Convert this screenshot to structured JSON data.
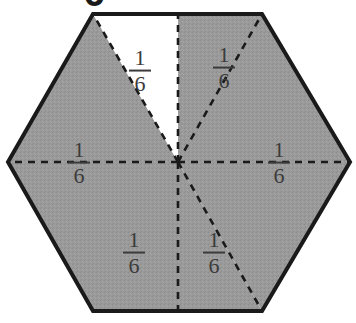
{
  "figure": {
    "name": "shaded-hexagon-sixths",
    "shape": "hexagon",
    "total_parts": 6,
    "shaded_parts": 5,
    "unshaded_parts": 1,
    "fill_shaded": "#9a9a9a",
    "fill_unshaded": "#ffffff",
    "outline_color": "#1a1a1a",
    "divider_color": "#1a1a1a",
    "divider_style": "dashed",
    "clipped_glyph_top": "6",
    "sectors": [
      {
        "id": "sector-top-left",
        "label_num": "1",
        "label_den": "6",
        "shaded": false,
        "cx": 140,
        "cy": 71
      },
      {
        "id": "sector-top-right",
        "label_num": "1",
        "label_den": "6",
        "shaded": true,
        "cx": 224,
        "cy": 68
      },
      {
        "id": "sector-right",
        "label_num": "1",
        "label_den": "6",
        "shaded": true,
        "cx": 279,
        "cy": 163
      },
      {
        "id": "sector-bottom-right",
        "label_num": "1",
        "label_den": "6",
        "shaded": true,
        "cx": 214,
        "cy": 253
      },
      {
        "id": "sector-bottom-left",
        "label_num": "1",
        "label_den": "6",
        "shaded": true,
        "cx": 134,
        "cy": 253
      },
      {
        "id": "sector-left",
        "label_num": "1",
        "label_den": "6",
        "shaded": true,
        "cx": 79,
        "cy": 163
      }
    ]
  }
}
